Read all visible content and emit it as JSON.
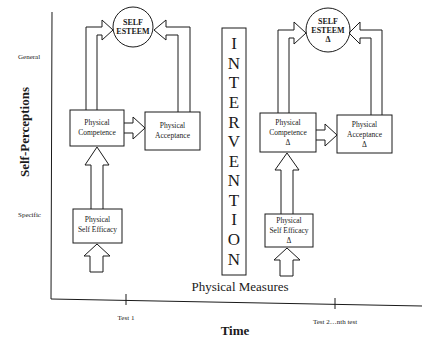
{
  "diagram": {
    "y_axis": {
      "title": "Self-Perceptions",
      "top_label": "General",
      "bottom_label": "Specific"
    },
    "x_axis": {
      "title": "Time",
      "ticks": [
        "Test 1",
        "Test 2…nth test"
      ]
    },
    "baseline_label": "Physical Measures",
    "intervention": {
      "label": "INTERVENTION",
      "letters": [
        "I",
        "N",
        "T",
        "E",
        "R",
        "V",
        "E",
        "N",
        "T",
        "I",
        "O",
        "N"
      ]
    },
    "pre": {
      "self_esteem": [
        "SELF",
        "ESTEEM"
      ],
      "physical_competence": [
        "Physical",
        "Competence"
      ],
      "physical_acceptance": [
        "Physical",
        "Acceptance"
      ],
      "physical_self_efficacy": [
        "Physical",
        "Self Efficacy"
      ]
    },
    "post": {
      "self_esteem": [
        "SELF",
        "ESTEEM",
        "Δ"
      ],
      "physical_competence": [
        "Physical",
        "Competence",
        "Δ"
      ],
      "physical_acceptance": [
        "Physical",
        "Acceptance",
        "Δ"
      ],
      "physical_self_efficacy": [
        "Physical",
        "Self Efficacy",
        "Δ"
      ]
    },
    "edges": [
      {
        "from": "Physical Self Efficacy",
        "to": "Physical Competence"
      },
      {
        "from": "Physical Competence",
        "to": "Physical Acceptance"
      },
      {
        "from": "Physical Competence",
        "to": "Self Esteem"
      },
      {
        "from": "Physical Acceptance",
        "to": "Self Esteem"
      },
      {
        "from": "Physical Measures",
        "to": "Physical Self Efficacy"
      }
    ]
  }
}
